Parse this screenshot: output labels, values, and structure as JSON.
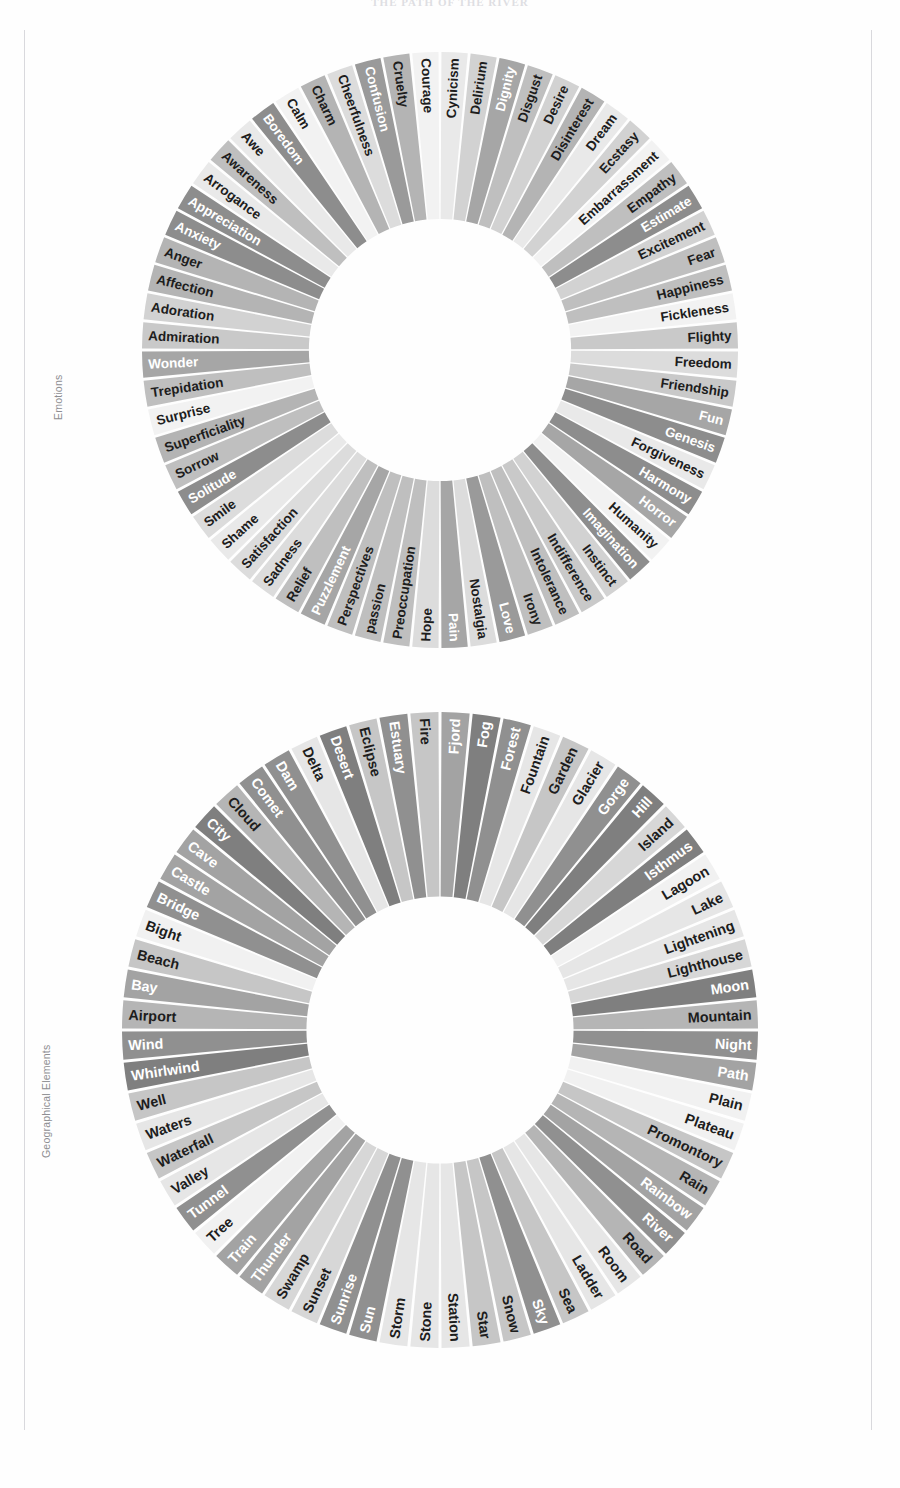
{
  "document": {
    "title": "THE PATH OF THE RIVER"
  },
  "figures": [
    {
      "id": "emotions",
      "label": "Emotions",
      "center_hole_ratio": 0.44,
      "start_angle_deg": -90,
      "palette": [
        "#8d8d8d",
        "#9a9a9a",
        "#b4b4b4",
        "#c9c9c9",
        "#dcdcdc",
        "#e9e9e9",
        "#f2f2f2",
        "#a6a6a6",
        "#bfbfbf",
        "#d2d2d2"
      ],
      "segments": [
        "Admiration",
        "Adoration",
        "Affection",
        "Anger",
        "Anxiety",
        "Appreciation",
        "Arrogance",
        "Awareness",
        "Awe",
        "Boredom",
        "Calm",
        "Charm",
        "Cheerfulness",
        "Confusion",
        "Cruelty",
        "Courage",
        "Cynicism",
        "Delirium",
        "Dignity",
        "Disgust",
        "Desire",
        "Disinterest",
        "Dream",
        "Ecstasy",
        "Embarrassment",
        "Empathy",
        "Estimate",
        "Excitement",
        "Fear",
        "Happiness",
        "Fickleness",
        "Flighty",
        "Freedom",
        "Friendship",
        "Fun",
        "Genesis",
        "Forgiveness",
        "Harmony",
        "Horror",
        "Humanity",
        "Imagination",
        "Instinct",
        "Indifference",
        "Intolerance",
        "Irony",
        "Love",
        "Nostalgia",
        "Pain",
        "Hope",
        "Preoccupation",
        "passion",
        "Perspectives",
        "Puzzlement",
        "Relief",
        "Sadness",
        "Satisfaction",
        "Shame",
        "Smile",
        "Solitude",
        "Sorrow",
        "Superficiality",
        "Surprise",
        "Trepidation",
        "Wonder"
      ],
      "tones": [
        3,
        3,
        3,
        3,
        3,
        3,
        3,
        3,
        4,
        4,
        4,
        4,
        4,
        4,
        4,
        4,
        4,
        4,
        4,
        4,
        4,
        4,
        4,
        4,
        4,
        4,
        4,
        4,
        4,
        4,
        4,
        4,
        1,
        1,
        1,
        1,
        1,
        1,
        1,
        1,
        1,
        1,
        1,
        1,
        1,
        1,
        1,
        1,
        1,
        1,
        1,
        1,
        1,
        1,
        1,
        1,
        1,
        1,
        1,
        1,
        1,
        1,
        1,
        1
      ]
    },
    {
      "id": "geographical",
      "label": "Geographical Elements",
      "center_hole_ratio": 0.42,
      "start_angle_deg": -90,
      "palette": [
        "#7f7f7f",
        "#909090",
        "#a3a3a3",
        "#b5b5b5",
        "#c6c6c6",
        "#d7d7d7",
        "#e6e6e6",
        "#f1f1f1"
      ],
      "segments": [
        "Airport",
        "Bay",
        "Beach",
        "Bight",
        "Bridge",
        "Castle",
        "Cave",
        "City",
        "Cloud",
        "Comet",
        "Dam",
        "Delta",
        "Desert",
        "Eclipse",
        "Estuary",
        "Fire",
        "Fjord",
        "Fog",
        "Forest",
        "Fountain",
        "Garden",
        "Glacier",
        "Gorge",
        "Hill",
        "Island",
        "Isthmus",
        "Lagoon",
        "Lake",
        "Lightening",
        "Lighthouse",
        "Moon",
        "Mountain",
        "Night",
        "Path",
        "Plain",
        "Plateau",
        "Promontory",
        "Rain",
        "Rainbow",
        "River",
        "Road",
        "Room",
        "Ladder",
        "Sea",
        "Sky",
        "Snow",
        "Star",
        "Station",
        "Stone",
        "Storm",
        "Sun",
        "Sunrise",
        "Sunset",
        "Swamp",
        "Thunder",
        "Train",
        "Tree",
        "Tunnel",
        "Valley",
        "Waterfall",
        "Waters",
        "Well",
        "Whirlwind",
        "Wind"
      ]
    }
  ]
}
